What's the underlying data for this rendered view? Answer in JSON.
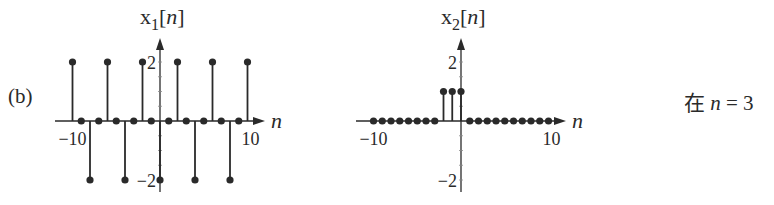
{
  "panel_label": "(b)",
  "note": {
    "prefix": "在",
    "var": "n",
    "rest": " = 3"
  },
  "chart_data": [
    {
      "type": "stem",
      "title": "x1[n]",
      "title_base": "x",
      "title_sub": "1",
      "title_arg": "[n]",
      "xlabel": "n",
      "ylabel": "x1[n]",
      "xlim": [
        -10,
        10
      ],
      "ylim": [
        -2,
        2
      ],
      "x_ticks": [
        "-10",
        "10"
      ],
      "y_ticks": [
        "2",
        "-2"
      ],
      "grid": false,
      "x": [
        -10,
        -9,
        -8,
        -7,
        -6,
        -5,
        -4,
        -3,
        -2,
        -1,
        0,
        1,
        2,
        3,
        4,
        5,
        6,
        7,
        8,
        9,
        10
      ],
      "values": [
        2,
        0,
        -2,
        0,
        2,
        0,
        -2,
        0,
        2,
        0,
        -2,
        0,
        2,
        0,
        -2,
        0,
        2,
        0,
        -2,
        0,
        2
      ]
    },
    {
      "type": "stem",
      "title": "x2[n]",
      "title_base": "x",
      "title_sub": "2",
      "title_arg": "[n]",
      "xlabel": "n",
      "ylabel": "x2[n]",
      "xlim": [
        -10,
        10
      ],
      "ylim": [
        -2,
        2
      ],
      "x_ticks": [
        "-10",
        "10"
      ],
      "y_ticks": [
        "2",
        "-2"
      ],
      "grid": false,
      "x": [
        -10,
        -9,
        -8,
        -7,
        -6,
        -5,
        -4,
        -3,
        -2,
        -1,
        0,
        1,
        2,
        3,
        4,
        5,
        6,
        7,
        8,
        9,
        10
      ],
      "values": [
        0,
        0,
        0,
        0,
        0,
        0,
        0,
        0,
        1,
        1,
        1,
        0,
        0,
        0,
        0,
        0,
        0,
        0,
        0,
        0,
        0
      ]
    }
  ],
  "colors": {
    "ink": "#2a2a2a",
    "background": "#ffffff"
  }
}
